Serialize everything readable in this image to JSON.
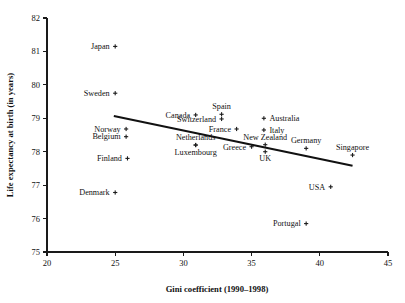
{
  "chart_data": {
    "type": "scatter",
    "title": "",
    "xlabel": "Gini coefficient (1990–1998)",
    "ylabel": "Life expectancy at birth (in years)",
    "xlim": [
      20,
      45
    ],
    "ylim": [
      75,
      82
    ],
    "xticks": [
      20,
      25,
      30,
      35,
      40,
      45
    ],
    "yticks": [
      75,
      76,
      77,
      78,
      79,
      80,
      81,
      82
    ],
    "xtick_labels": [
      "20",
      "25",
      "30",
      "35",
      "40",
      "45"
    ],
    "ytick_labels": [
      "75",
      "76",
      "77",
      "78",
      "79",
      "80",
      "81",
      "82"
    ],
    "grid": false,
    "legend": null,
    "marker_symbol": "small-cross",
    "points": [
      {
        "label": "Japan",
        "x": 25.0,
        "y": 81.15,
        "label_pos": "left"
      },
      {
        "label": "Sweden",
        "x": 25.0,
        "y": 79.75,
        "label_pos": "left"
      },
      {
        "label": "Canada",
        "x": 30.9,
        "y": 79.1,
        "label_pos": "left"
      },
      {
        "label": "Spain",
        "x": 32.8,
        "y": 79.12,
        "label_pos": "above"
      },
      {
        "label": "Switzerland",
        "x": 32.8,
        "y": 78.98,
        "label_pos": "left"
      },
      {
        "label": "Australia",
        "x": 35.9,
        "y": 79.0,
        "label_pos": "right"
      },
      {
        "label": "Norway",
        "x": 25.8,
        "y": 78.68,
        "label_pos": "left"
      },
      {
        "label": "France",
        "x": 33.9,
        "y": 78.68,
        "label_pos": "left"
      },
      {
        "label": "Italy",
        "x": 35.9,
        "y": 78.65,
        "label_pos": "right"
      },
      {
        "label": "Belgium",
        "x": 25.8,
        "y": 78.45,
        "label_pos": "left"
      },
      {
        "label": "New Zealand",
        "x": 36.0,
        "y": 78.21,
        "label_pos": "above"
      },
      {
        "label": "Netherlands",
        "x": 30.9,
        "y": 78.2,
        "label_pos": "above"
      },
      {
        "label": "Luxembourg",
        "x": 30.9,
        "y": 78.2,
        "label_pos": "below"
      },
      {
        "label": "Greece",
        "x": 35.0,
        "y": 78.15,
        "label_pos": "left"
      },
      {
        "label": "Germany",
        "x": 39.0,
        "y": 78.1,
        "label_pos": "above"
      },
      {
        "label": "UK",
        "x": 36.0,
        "y": 78.0,
        "label_pos": "below"
      },
      {
        "label": "Finland",
        "x": 25.9,
        "y": 77.8,
        "label_pos": "left"
      },
      {
        "label": "Singapore",
        "x": 42.4,
        "y": 77.9,
        "label_pos": "above"
      },
      {
        "label": "USA",
        "x": 40.8,
        "y": 76.95,
        "label_pos": "left"
      },
      {
        "label": "Denmark",
        "x": 25.0,
        "y": 76.78,
        "label_pos": "left"
      },
      {
        "label": "Portugal",
        "x": 39.0,
        "y": 75.85,
        "label_pos": "left"
      }
    ],
    "trend_line": {
      "x1": 24.9,
      "y1": 79.07,
      "x2": 42.4,
      "y2": 77.58
    }
  },
  "colors": {
    "axis": "#1a1a1a",
    "marker": "#1c1c1c",
    "trend": "#111111",
    "background": "#ffffff"
  }
}
